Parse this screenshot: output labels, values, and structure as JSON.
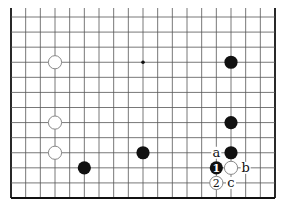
{
  "diagram": {
    "type": "go-board-partial",
    "board_size": 19,
    "visible_rows_from_bottom": 13,
    "top_edge_cut": true,
    "colors": {
      "line": "#555555",
      "edge": "#111111",
      "black": "#111111",
      "white": "#ffffff",
      "white_outline": "#888888"
    },
    "star_points": [
      {
        "col": 9,
        "row": 3
      }
    ],
    "stones": [
      {
        "color": "white",
        "col": 3,
        "row": 3
      },
      {
        "color": "white",
        "col": 3,
        "row": 7
      },
      {
        "color": "white",
        "col": 3,
        "row": 9
      },
      {
        "color": "black",
        "col": 5,
        "row": 10
      },
      {
        "color": "black",
        "col": 9,
        "row": 9
      },
      {
        "color": "black",
        "col": 15,
        "row": 3
      },
      {
        "color": "black",
        "col": 15,
        "row": 7
      },
      {
        "color": "black",
        "col": 15,
        "row": 9
      },
      {
        "color": "white",
        "col": 15,
        "row": 10
      },
      {
        "color": "black",
        "col": 14,
        "row": 10,
        "move": "1"
      },
      {
        "color": "white",
        "col": 14,
        "row": 11,
        "move": "2"
      }
    ],
    "labels": [
      {
        "text": "a",
        "col": 14,
        "row": 9
      },
      {
        "text": "b",
        "col": 16,
        "row": 10
      },
      {
        "text": "c",
        "col": 15,
        "row": 11
      }
    ]
  }
}
